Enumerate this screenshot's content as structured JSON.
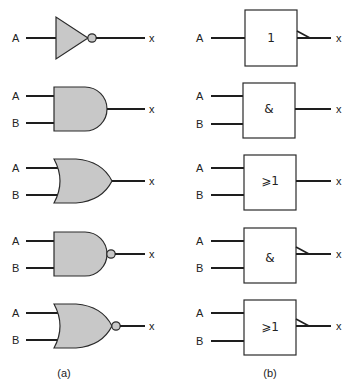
{
  "diagram": {
    "columns": {
      "a": {
        "caption": "(a)",
        "style": "distinctive-shape"
      },
      "b": {
        "caption": "(b)",
        "style": "rectangular-IEC"
      }
    },
    "gates": [
      {
        "type": "NOT",
        "inputs": [
          "A"
        ],
        "output": "x",
        "symbol": "1",
        "inverted": true
      },
      {
        "type": "AND",
        "inputs": [
          "A",
          "B"
        ],
        "output": "x",
        "symbol": "&",
        "inverted": false
      },
      {
        "type": "OR",
        "inputs": [
          "A",
          "B"
        ],
        "output": "x",
        "symbol": "⩾1",
        "inverted": false
      },
      {
        "type": "NAND",
        "inputs": [
          "A",
          "B"
        ],
        "output": "x",
        "symbol": "&",
        "inverted": true
      },
      {
        "type": "NOR",
        "inputs": [
          "A",
          "B"
        ],
        "output": "x",
        "symbol": "⩾1",
        "inverted": true
      }
    ],
    "colors": {
      "gate_fill": "#c8c8c8",
      "stroke": "#1e1e1e",
      "background": "#ffffff"
    }
  }
}
